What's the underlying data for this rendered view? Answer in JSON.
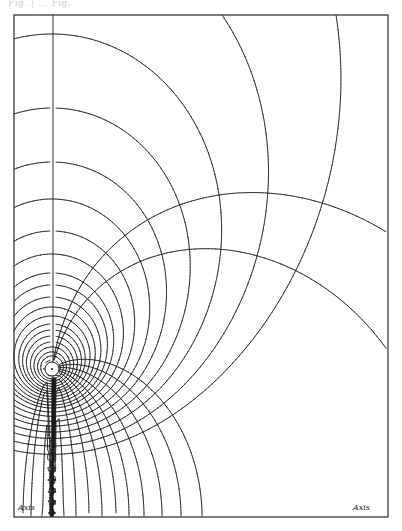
{
  "figure": {
    "header_text": "Fig. | ... Fig.",
    "labels": {
      "axis_left": "Axis",
      "axis_right": "Axis"
    },
    "frame": {
      "left": 14,
      "top": 15,
      "right": 388,
      "bottom": 517
    },
    "colors": {
      "ink": "#1a1a1a",
      "paper": "#ffffff",
      "frame": "#2a2a2a"
    },
    "pole": {
      "x": 52,
      "y": 369,
      "inner_circle_radius": 7
    },
    "ring_plane_line_x": 53,
    "axis_line_y": 517,
    "lines_of_force": {
      "description": "closed loops around the pole (stream function of circular current)",
      "crossings_on_ring_plane_above_pole_y": [
        34,
        108,
        162,
        199,
        231,
        254,
        273,
        285,
        297,
        307,
        316,
        324,
        330,
        336,
        342,
        347,
        352,
        356,
        360
      ],
      "crossings_on_top_edge_x": [
        222,
        336
      ]
    },
    "equipotentials": {
      "description": "surfaces radiating from the pole and meeting the axis perpendicularly",
      "crossings_on_axis_x": [
        23,
        31,
        42,
        64,
        76,
        89,
        102,
        116,
        129,
        144,
        162,
        181,
        202
      ],
      "crossings_on_axis_left_x": [],
      "crossings_on_right_edge_y": [
        233,
        351
      ]
    }
  }
}
